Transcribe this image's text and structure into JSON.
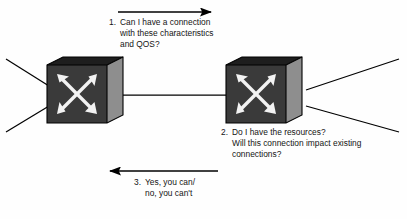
{
  "diagram": {
    "background_color": "#fefefe",
    "text_color": "#141414",
    "line_color": "#000000",
    "nodes": [
      {
        "id": "switch-left",
        "type": "network-switch",
        "icon_name": "switch-icon",
        "front_face_color": "#3a3a3a",
        "top_face_color": "#1e1e1e",
        "side_face_color": "#8e8e8e",
        "arrow_glyph_color": "#f2f2f2",
        "external_links": 2
      },
      {
        "id": "switch-right",
        "type": "network-switch",
        "icon_name": "switch-icon",
        "front_face_color": "#3a3a3a",
        "top_face_color": "#1e1e1e",
        "side_face_color": "#8e8e8e",
        "arrow_glyph_color": "#f2f2f2",
        "external_links": 2
      }
    ],
    "connections": [
      {
        "id": "trunk-link",
        "from": "switch-left",
        "to": "switch-right",
        "style": "solid",
        "arrowheads": "none"
      }
    ],
    "flow_arrows": [
      {
        "id": "request-arrow",
        "direction": "right",
        "label_ref": "note_1"
      },
      {
        "id": "response-arrow",
        "direction": "left",
        "label_ref": "note_3"
      }
    ],
    "notes": {
      "note_1": {
        "number": "1.",
        "lines": [
          "Can I have a connection",
          "with these characteristics",
          "and QOS?"
        ]
      },
      "note_2": {
        "number": "2.",
        "lines": [
          "Do I have the resources?",
          "Will this connection impact existing",
          "connections?"
        ]
      },
      "note_3": {
        "number": "3.",
        "lines": [
          "Yes, you can/",
          "no, you can't"
        ]
      }
    }
  }
}
